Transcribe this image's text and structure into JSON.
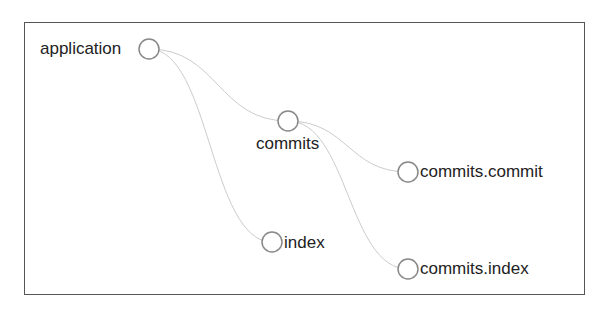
{
  "diagram": {
    "type": "tree",
    "nodes": [
      {
        "id": "application",
        "label": "application",
        "x": 149,
        "y": 49,
        "label_side": "left"
      },
      {
        "id": "commits",
        "label": "commits",
        "x": 288,
        "y": 121,
        "label_side": "below"
      },
      {
        "id": "index",
        "label": "index",
        "x": 272,
        "y": 242,
        "label_side": "right"
      },
      {
        "id": "commits_commit",
        "label": "commits.commit",
        "x": 408,
        "y": 172,
        "label_side": "right"
      },
      {
        "id": "commits_index",
        "label": "commits.index",
        "x": 408,
        "y": 269,
        "label_side": "right"
      }
    ],
    "edges": [
      {
        "from": "application",
        "to": "commits"
      },
      {
        "from": "application",
        "to": "index"
      },
      {
        "from": "commits",
        "to": "commits_commit"
      },
      {
        "from": "commits",
        "to": "commits_index"
      }
    ],
    "colors": {
      "node_stroke": "#888888",
      "edge": "#cccccc",
      "frame": "#555555",
      "text": "#222222"
    }
  }
}
